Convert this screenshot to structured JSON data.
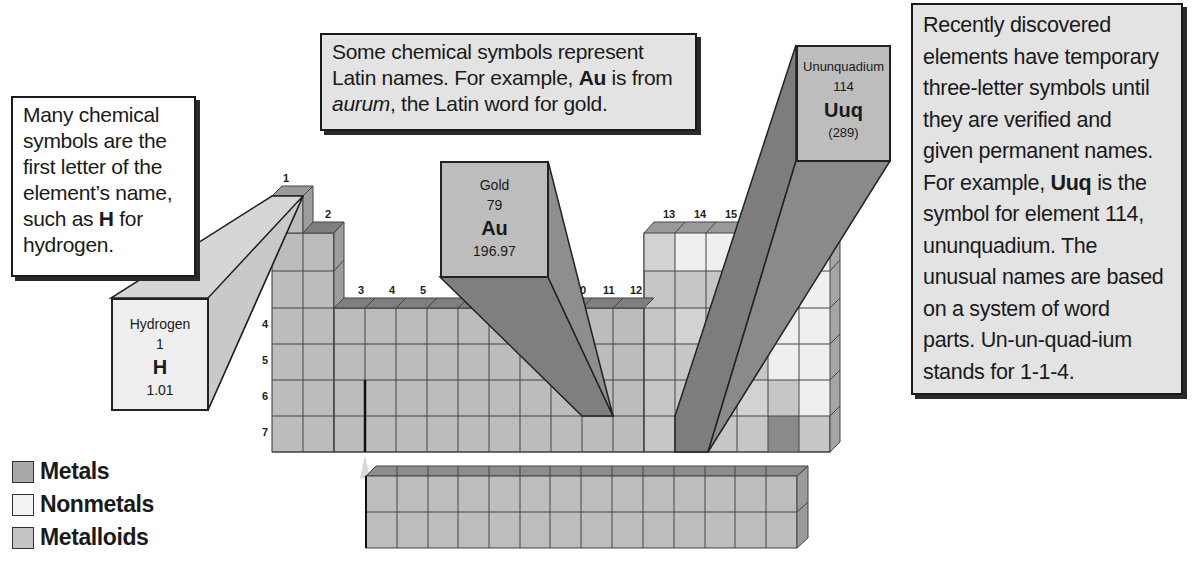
{
  "colors": {
    "metal": "#b9b9b9",
    "metal_top": "#8f8f8f",
    "metal_side": "#9c9c9c",
    "nonmetal": "#efefef",
    "metalloid": "#cfcfcf",
    "dark_cell": "#8a8a8a",
    "beam_dark": "#7f7f7f",
    "beam_light": "#d6d6d6",
    "callout_gray": "#e3e3e3"
  },
  "callouts": {
    "hydrogen_note": {
      "lines": [
        "Many chemical",
        "symbols are the",
        "first letter of the",
        "element’s name,",
        "such as ",
        "H",
        " for",
        "hydrogen."
      ]
    },
    "latin_note": {
      "line1": "Some chemical symbols represent",
      "line2_pre": "Latin names. For example, ",
      "line2_bold": "Au",
      "line2_post": " is from",
      "line3_italic": "aurum",
      "line3_post": ", the Latin word for gold."
    },
    "temporary_note": {
      "l1": "Recently discovered",
      "l2": "elements have temporary",
      "l3": "three-letter symbols until",
      "l4": "they are verified and",
      "l5": "given permanent names.",
      "l6_pre": "For example, ",
      "l6_bold": "Uuq",
      "l6_post": " is the",
      "l7": "symbol for element 114,",
      "l8": "ununquadium. The",
      "l9": "unusual names are based",
      "l10": "on a system of word",
      "l11": "parts. Un-un-quad-ium",
      "l12": "stands for 1-1-4."
    }
  },
  "element_tiles": {
    "hydrogen": {
      "name": "Hydrogen",
      "number": "1",
      "symbol": "H",
      "mass": "1.01"
    },
    "gold": {
      "name": "Gold",
      "number": "79",
      "symbol": "Au",
      "mass": "196.97"
    },
    "ununquadium": {
      "name": "Ununquadium",
      "number": "114",
      "symbol": "Uuq",
      "mass": "(289)"
    }
  },
  "group_numbers": [
    "1",
    "2",
    "3",
    "4",
    "5",
    "",
    "",
    "",
    "",
    "10",
    "11",
    "12",
    "13",
    "14",
    "15"
  ],
  "group_labels": {
    "g1": "1",
    "g2": "2",
    "g3": "3",
    "g4": "4",
    "g5": "5",
    "g10": "0",
    "g11": "11",
    "g12": "12",
    "g13": "13",
    "g14": "14",
    "g15": "15"
  },
  "period_labels": {
    "p4": "4",
    "p5": "5",
    "p6": "6",
    "p7": "7"
  },
  "legend": [
    {
      "label": "Metals",
      "color": "#a9a9a9"
    },
    {
      "label": "Nonmetals",
      "color": "#f2f2f2"
    },
    {
      "label": "Metalloids",
      "color": "#c4c4c4"
    }
  ]
}
